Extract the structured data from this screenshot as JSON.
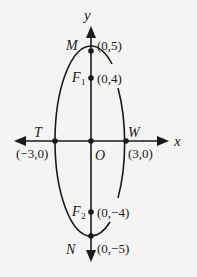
{
  "diagram": {
    "type": "ellipse-on-axes",
    "axes": {
      "x_label": "x",
      "y_label": "y",
      "origin_label": "O"
    },
    "points": {
      "M": {
        "name": "M",
        "coord": "(0,5)"
      },
      "F1": {
        "name": "F",
        "sub": "1",
        "coord": "(0,4)"
      },
      "T": {
        "name": "T",
        "coord": "(−3,0)"
      },
      "W": {
        "name": "W",
        "coord": "(3,0)"
      },
      "F2": {
        "name": "F",
        "sub": "2",
        "coord": "(0,−4)"
      },
      "N": {
        "name": "N",
        "coord": "(0,−5)"
      }
    },
    "colors": {
      "stroke": "#1a1a1a",
      "background": "#f4f4f2"
    }
  }
}
